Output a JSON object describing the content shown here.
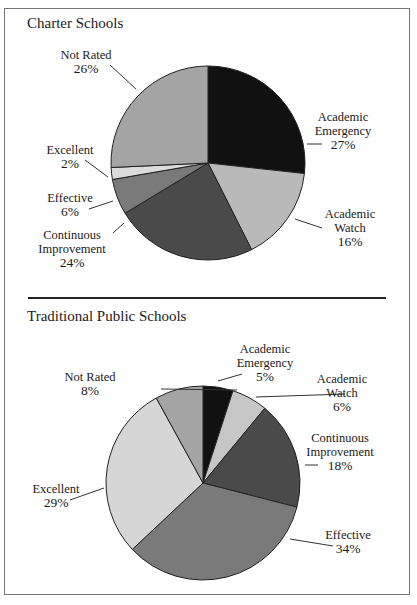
{
  "chart_data": [
    {
      "type": "pie",
      "title": "Charter Schools",
      "categories": [
        "Academic Emergency",
        "Academic Watch",
        "Continuous Improvement",
        "Effective",
        "Excellent",
        "Not Rated"
      ],
      "values": [
        27,
        16,
        24,
        6,
        2,
        26
      ],
      "labels": [
        "27%",
        "16%",
        "24%",
        "6%",
        "2%",
        "26%"
      ],
      "colors": [
        "#111111",
        "#b9b9b9",
        "#4a4a4a",
        "#7a7a7a",
        "#dcdcdc",
        "#a4a4a4"
      ],
      "start_angle": "12 o'clock, clockwise"
    },
    {
      "type": "pie",
      "title": "Traditional Public Schools",
      "categories": [
        "Academic Emergency",
        "Academic Watch",
        "Continuous Improvement",
        "Effective",
        "Excellent",
        "Not Rated"
      ],
      "values": [
        5,
        6,
        18,
        34,
        29,
        8
      ],
      "labels": [
        "5%",
        "6%",
        "18%",
        "34%",
        "29%",
        "8%"
      ],
      "colors": [
        "#111111",
        "#c6c6c6",
        "#4a4a4a",
        "#7a7a7a",
        "#d6d6d6",
        "#a4a4a4"
      ],
      "start_angle": "12 o'clock, clockwise"
    }
  ],
  "charter": {
    "title": "Charter Schools",
    "labels": {
      "emergency": {
        "l1": "Academic",
        "l2": "Emergency",
        "pct": "27%"
      },
      "watch": {
        "l1": "Academic",
        "l2": "Watch",
        "pct": "16%"
      },
      "continuous": {
        "l1": "Continuous",
        "l2": "Improvement",
        "pct": "24%"
      },
      "effective": {
        "l1": "Effective",
        "pct": "6%"
      },
      "excellent": {
        "l1": "Excellent",
        "pct": "2%"
      },
      "notrated": {
        "l1": "Not Rated",
        "pct": "26%"
      }
    }
  },
  "public": {
    "title": "Traditional Public Schools",
    "labels": {
      "emergency": {
        "l1": "Academic",
        "l2": "Emergency",
        "pct": "5%"
      },
      "watch": {
        "l1": "Academic",
        "l2": "Watch",
        "pct": "6%"
      },
      "continuous": {
        "l1": "Continuous",
        "l2": "Improvement",
        "pct": "18%"
      },
      "effective": {
        "l1": "Effective",
        "pct": "34%"
      },
      "excellent": {
        "l1": "Excellent",
        "pct": "29%"
      },
      "notrated": {
        "l1": "Not Rated",
        "pct": "8%"
      }
    }
  }
}
